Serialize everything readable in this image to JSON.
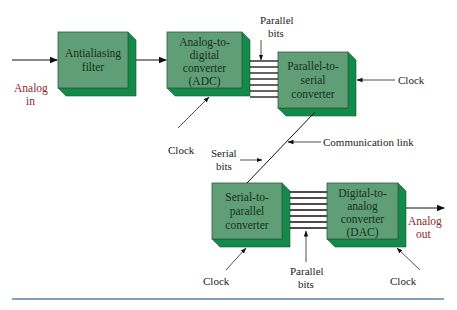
{
  "diagram": {
    "blocks": [
      {
        "id": "antialiasing-filter",
        "lines": [
          "Antialiasing",
          "filter"
        ]
      },
      {
        "id": "adc",
        "lines": [
          "Analog-to-",
          "digital",
          "converter",
          "(ADC)"
        ]
      },
      {
        "id": "parallel-to-serial",
        "lines": [
          "Parallel-to-",
          "serial",
          "converter"
        ]
      },
      {
        "id": "serial-to-parallel",
        "lines": [
          "Serial-to-",
          "parallel",
          "converter"
        ]
      },
      {
        "id": "dac",
        "lines": [
          "Digital-to-",
          "analog",
          "converter",
          "(DAC)"
        ]
      }
    ],
    "labels": {
      "analog_in": [
        "Analog",
        "in"
      ],
      "analog_out": [
        "Analog",
        "out"
      ],
      "parallel_bits_top": [
        "Parallel",
        "bits"
      ],
      "parallel_bits_bottom": [
        "Parallel",
        "bits"
      ],
      "serial_bits": [
        "Serial",
        "bits"
      ],
      "communication_link": "Communication link",
      "clock_adc": "Clock",
      "clock_p2s": "Clock",
      "clock_s2p": "Clock",
      "clock_dac": "Clock"
    },
    "colors": {
      "block_face": "#5f9e76",
      "block_side": "#138a4a",
      "analog_label": "#8b2a2a",
      "rule_line": "#5b7fa8"
    }
  }
}
